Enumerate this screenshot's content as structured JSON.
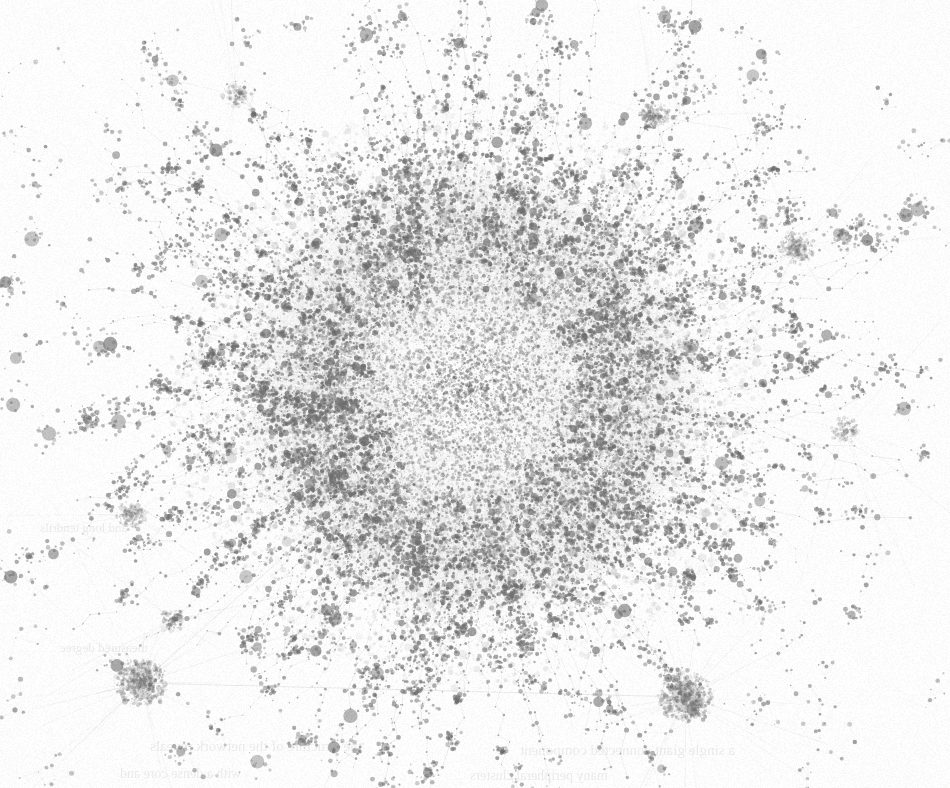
{
  "figure": {
    "kind": "network-graph",
    "title": "",
    "caption": "",
    "background_color": "#fdfdfd",
    "width": 950,
    "height": 788,
    "colorspace": "grayscale",
    "medium": "scanned-page"
  },
  "chart_data": {
    "type": "scatter",
    "subtype": "force-directed-node-link-graph",
    "title": "",
    "subtitle": "",
    "xlabel": "",
    "ylabel": "",
    "legend": [],
    "grid": false,
    "axes_visible": false,
    "tick_labels": [],
    "annotations": [],
    "layout": {
      "algorithm": "force-directed",
      "center_x": 470,
      "center_y": 392,
      "core_radius": 190,
      "halo_radius": 330,
      "bbox": [
        30,
        20,
        920,
        760
      ]
    },
    "node_count": 26000,
    "edge_count": 34000,
    "node_color": "#6e6e6e",
    "edge_color": "#8d8d8d",
    "node_min_radius": 0.55,
    "node_max_radius": 7.5,
    "edge_width": 0.35,
    "clusters": [
      {
        "name": "dense-core",
        "x": 470,
        "y": 392,
        "radius": 185,
        "nodes": 11000,
        "density": "very-high",
        "darkness": 0.62
      },
      {
        "name": "core-halo",
        "x": 470,
        "y": 392,
        "radius": 300,
        "nodes": 8200,
        "density": "high",
        "darkness": 0.42
      },
      {
        "name": "hub-bottom-left",
        "x": 141,
        "y": 683,
        "radius": 26,
        "nodes": 430,
        "density": "very-high",
        "darkness": 0.85
      },
      {
        "name": "hub-bottom-right",
        "x": 686,
        "y": 697,
        "radius": 27,
        "nodes": 460,
        "density": "very-high",
        "darkness": 0.85
      },
      {
        "name": "cluster-upper-right",
        "x": 797,
        "y": 248,
        "radius": 17,
        "nodes": 180,
        "density": "high",
        "darkness": 0.7
      },
      {
        "name": "cluster-upper-mid",
        "x": 654,
        "y": 116,
        "radius": 13,
        "nodes": 140,
        "density": "high",
        "darkness": 0.78
      },
      {
        "name": "cluster-left-mid",
        "x": 131,
        "y": 515,
        "radius": 14,
        "nodes": 130,
        "density": "high",
        "darkness": 0.74
      },
      {
        "name": "cluster-upper-left",
        "x": 236,
        "y": 95,
        "radius": 12,
        "nodes": 110,
        "density": "medium",
        "darkness": 0.62
      },
      {
        "name": "cluster-right-mid",
        "x": 690,
        "y": 347,
        "radius": 11,
        "nodes": 95,
        "density": "medium",
        "darkness": 0.72
      },
      {
        "name": "cluster-right-low",
        "x": 845,
        "y": 430,
        "radius": 13,
        "nodes": 105,
        "density": "medium",
        "darkness": 0.66
      },
      {
        "name": "cluster-lower-left",
        "x": 173,
        "y": 620,
        "radius": 12,
        "nodes": 100,
        "density": "medium",
        "darkness": 0.64
      }
    ],
    "spokes": {
      "count": 230,
      "description": "radial filament chains of nodes extending outward from the dense core",
      "min_length": 60,
      "max_length": 300
    },
    "outliers": {
      "count": 180,
      "description": "small isolated node chains and specks beyond the halo"
    },
    "long_edges": [
      {
        "from": "hub-bottom-left",
        "to": "hub-bottom-right"
      },
      {
        "from": "hub-bottom-left",
        "to": "dense-core"
      },
      {
        "from": "hub-bottom-right",
        "to": "dense-core"
      }
    ]
  },
  "scan_bleed": {
    "visible": true,
    "opacity": 0.26,
    "color": "#b9b9bb",
    "lines": [
      {
        "text": "the structure of the network reveals",
        "x": 150,
        "y": 738,
        "size": 15
      },
      {
        "text": "a single giant connected component",
        "x": 520,
        "y": 742,
        "size": 15
      },
      {
        "text": "with a dense core and",
        "x": 120,
        "y": 766,
        "size": 14
      },
      {
        "text": "many peripheral clusters",
        "x": 470,
        "y": 768,
        "size": 14
      },
      {
        "text": "and long tendrils",
        "x": 40,
        "y": 520,
        "size": 13
      },
      {
        "text": "measured degree",
        "x": 60,
        "y": 640,
        "size": 13
      }
    ]
  },
  "accessibility": {
    "alt_text": "A grayscale force-directed network graph with an extremely dense central hairball core, radial filament spokes extending outward, numerous small peripheral clusters, and two prominent dark hub clusters near the bottom left and bottom right."
  }
}
